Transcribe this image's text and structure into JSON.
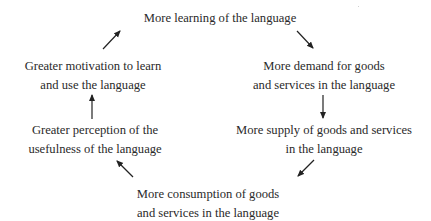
{
  "diagram": {
    "type": "cycle",
    "nodes": [
      {
        "id": "top",
        "lines": [
          "More learning of the language"
        ]
      },
      {
        "id": "right1",
        "lines": [
          "More demand for goods",
          "and services in the language"
        ]
      },
      {
        "id": "right2",
        "lines": [
          "More supply of goods and services",
          "in the language"
        ]
      },
      {
        "id": "bottom",
        "lines": [
          "More consumption of goods",
          "and services in the language"
        ]
      },
      {
        "id": "left2",
        "lines": [
          "Greater perception of the",
          "usefulness of the language"
        ]
      },
      {
        "id": "left1",
        "lines": [
          "Greater motivation to learn",
          "and use the language"
        ]
      }
    ],
    "edges": [
      {
        "from": "top",
        "to": "right1",
        "direction": "down-right"
      },
      {
        "from": "right1",
        "to": "right2",
        "direction": "down"
      },
      {
        "from": "right2",
        "to": "bottom",
        "direction": "down-left"
      },
      {
        "from": "bottom",
        "to": "left2",
        "direction": "up-left"
      },
      {
        "from": "left2",
        "to": "left1",
        "direction": "up"
      },
      {
        "from": "left1",
        "to": "top",
        "direction": "up-right"
      }
    ],
    "colors": {
      "text": "#2a2a2a",
      "arrow": "#222222",
      "background": "#ffffff"
    }
  }
}
